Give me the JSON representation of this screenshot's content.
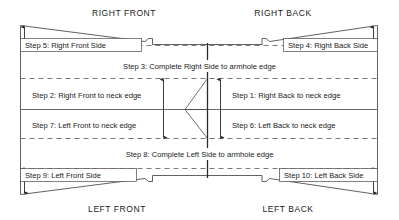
{
  "diagram": {
    "title_quadrants": {
      "top_left": "RIGHT FRONT",
      "top_right": "RIGHT BACK",
      "bottom_left": "LEFT FRONT",
      "bottom_right": "LEFT BACK"
    },
    "steps": [
      {
        "id": "step-1",
        "label": "Step 1: Right Back to neck edge"
      },
      {
        "id": "step-2",
        "label": "Step 2: Right Front to neck edge"
      },
      {
        "id": "step-3",
        "label": "Step 3: Complete Right Side to armhole edge"
      },
      {
        "id": "step-4",
        "label": "Step 4: Right Back Side"
      },
      {
        "id": "step-5",
        "label": "Step 5: Right Front Side"
      },
      {
        "id": "step-6",
        "label": "Step 6: Left Back to neck edge"
      },
      {
        "id": "step-7",
        "label": "Step 7: Left Front to neck edge"
      },
      {
        "id": "step-8",
        "label": "Step 8: Complete Left Side to armhole edge"
      },
      {
        "id": "step-9",
        "label": "Step 9: Left Front Side"
      },
      {
        "id": "step-10",
        "label": "Step 10: Left Back Side"
      }
    ],
    "colors": {
      "outline": "#3a3a3a",
      "rule": "#5a5a5a",
      "dashed": "#6a6a6a",
      "center": "#2a2a2a",
      "text": "#1a1a1a",
      "background": "#ffffff"
    }
  }
}
